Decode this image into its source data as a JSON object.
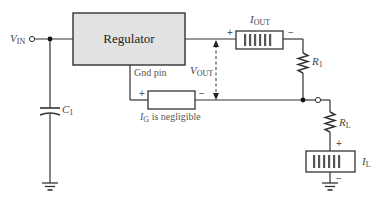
{
  "diagram": {
    "colors": {
      "wire": "#333333",
      "regulator_fill": "#e2e2e2",
      "text": "#333333",
      "background": "#ffffff"
    },
    "regulator": {
      "label": "Regulator"
    },
    "gnd_pin": {
      "label": "Gnd pin"
    },
    "input": {
      "label_main": "V",
      "label_sub": "IN"
    },
    "output_voltage": {
      "label_main": "V",
      "label_sub": "OUT"
    },
    "ammeter_out": {
      "label_main": "I",
      "label_sub": "OUT",
      "plus": "+",
      "minus": "−"
    },
    "ammeter_gnd": {
      "label_main": "I",
      "label_sub": "G",
      "label_suffix": " is negligible",
      "plus": "+",
      "minus": "−"
    },
    "ammeter_load": {
      "label_main": "I",
      "label_sub": "L",
      "plus": "+",
      "minus": "−"
    },
    "resistor_r1": {
      "label_main": "R",
      "label_sub": "1"
    },
    "resistor_rl": {
      "label_main": "R",
      "label_sub": "L"
    },
    "capacitor_c1": {
      "label_main": "C",
      "label_sub": "1"
    }
  }
}
